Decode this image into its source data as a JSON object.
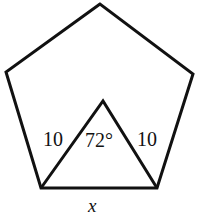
{
  "figure": {
    "type": "geometry-diagram",
    "shapes": [
      {
        "name": "regular-pentagon",
        "vertices": [
          [
            100,
            4
          ],
          [
            6,
            72
          ],
          [
            41,
            188
          ],
          [
            157,
            188
          ],
          [
            193,
            74
          ]
        ]
      },
      {
        "name": "isosceles-triangle",
        "vertices": [
          [
            103,
            101
          ],
          [
            41,
            188
          ],
          [
            157,
            188
          ]
        ]
      }
    ],
    "labels": {
      "left_side": "10",
      "right_side": "10",
      "apex_angle": "72°",
      "base": "x"
    },
    "colors": {
      "stroke": "#111111",
      "background": "#ffffff"
    }
  }
}
